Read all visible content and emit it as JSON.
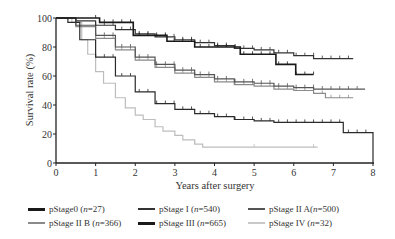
{
  "chart_data": {
    "type": "line",
    "subtype": "kaplan-meier",
    "title": "",
    "xlabel": "Years after surgery",
    "ylabel": "Survival rate (%)",
    "xlim": [
      0,
      8
    ],
    "ylim": [
      0,
      100
    ],
    "xticks": [
      "0",
      "1",
      "2",
      "3",
      "4",
      "5",
      "6",
      "7",
      "8"
    ],
    "yticks": [
      "0",
      "20",
      "40",
      "60",
      "80",
      "100"
    ],
    "grid": false,
    "legend_position": "bottom",
    "series": [
      {
        "name": "pStage0 (n=27)",
        "label_main": "pStage0 (",
        "n": "n",
        "count": "=27)",
        "color": "#1a1a1a",
        "width": 1.6,
        "points": [
          [
            0,
            100
          ],
          [
            0.35,
            100
          ],
          [
            0.35,
            100
          ],
          [
            1.1,
            100
          ],
          [
            1.1,
            97
          ],
          [
            1.95,
            97
          ],
          [
            1.95,
            88
          ],
          [
            2.8,
            88
          ],
          [
            2.8,
            84
          ],
          [
            3.5,
            84
          ],
          [
            3.5,
            80
          ],
          [
            4.65,
            80
          ],
          [
            4.65,
            75
          ],
          [
            5.55,
            75
          ],
          [
            5.55,
            68
          ],
          [
            6.05,
            68
          ],
          [
            6.05,
            61
          ],
          [
            6.5,
            61
          ]
        ]
      },
      {
        "name": "pStage I (n=540)",
        "label_main": "pStage I (",
        "n": "n",
        "count": "=540)",
        "color": "#333333",
        "width": 1.2,
        "points": [
          [
            0,
            100
          ],
          [
            0.5,
            98
          ],
          [
            1.0,
            95
          ],
          [
            1.5,
            92
          ],
          [
            2.0,
            89
          ],
          [
            2.5,
            87
          ],
          [
            3.0,
            85
          ],
          [
            3.5,
            83
          ],
          [
            4.0,
            81
          ],
          [
            4.5,
            79
          ],
          [
            5.0,
            78
          ],
          [
            5.5,
            76
          ],
          [
            6.0,
            74
          ],
          [
            6.5,
            72
          ],
          [
            7.0,
            72
          ],
          [
            7.5,
            72
          ]
        ]
      },
      {
        "name": "pStage II A (n=500)",
        "label_main": "pStage II A(",
        "n": "n",
        "count": "=500)",
        "color": "#555555",
        "width": 1.2,
        "points": [
          [
            0,
            100
          ],
          [
            0.5,
            95
          ],
          [
            1.0,
            88
          ],
          [
            1.5,
            80
          ],
          [
            2.0,
            73
          ],
          [
            2.5,
            68
          ],
          [
            3.0,
            64
          ],
          [
            3.5,
            61
          ],
          [
            4.0,
            58
          ],
          [
            4.5,
            56
          ],
          [
            5.0,
            55
          ],
          [
            5.5,
            53
          ],
          [
            6.0,
            52
          ],
          [
            6.5,
            51
          ],
          [
            7.0,
            51
          ],
          [
            7.5,
            51
          ],
          [
            7.8,
            51
          ]
        ]
      },
      {
        "name": "pStage II B (n=366)",
        "label_main": "pStage II B (",
        "n": "n",
        "count": "=366)",
        "color": "#8a8a8a",
        "width": 1.2,
        "points": [
          [
            0,
            100
          ],
          [
            0.5,
            94
          ],
          [
            1.0,
            86
          ],
          [
            1.5,
            78
          ],
          [
            2.0,
            71
          ],
          [
            2.5,
            66
          ],
          [
            3.0,
            62
          ],
          [
            3.5,
            59
          ],
          [
            4.0,
            56
          ],
          [
            4.5,
            54
          ],
          [
            5.0,
            53
          ],
          [
            5.5,
            51
          ],
          [
            6.0,
            50
          ],
          [
            6.5,
            48
          ],
          [
            6.8,
            48
          ],
          [
            6.8,
            45
          ],
          [
            7.5,
            45
          ]
        ]
      },
      {
        "name": "pStage III (n=665)",
        "label_main": "pStage III (",
        "n": "n",
        "count": "=665)",
        "color": "#2a2a2a",
        "width": 1.2,
        "points": [
          [
            0,
            100
          ],
          [
            0.3,
            97
          ],
          [
            0.6,
            85
          ],
          [
            1.0,
            73
          ],
          [
            1.5,
            60
          ],
          [
            2.0,
            49
          ],
          [
            2.5,
            41
          ],
          [
            3.0,
            37
          ],
          [
            3.5,
            34
          ],
          [
            4.0,
            32
          ],
          [
            4.5,
            30
          ],
          [
            5.0,
            29
          ],
          [
            5.5,
            28
          ],
          [
            6.0,
            28
          ],
          [
            6.5,
            28
          ],
          [
            7.0,
            28
          ],
          [
            7.25,
            28
          ],
          [
            7.25,
            21
          ],
          [
            8.0,
            21
          ],
          [
            8.0,
            0
          ]
        ]
      },
      {
        "name": "pStage IV (n=32)",
        "label_main": "pStage IV (",
        "n": "n",
        "count": "=32)",
        "color": "#bdbdbd",
        "width": 1.2,
        "points": [
          [
            0,
            100
          ],
          [
            0.4,
            97
          ],
          [
            0.65,
            85
          ],
          [
            0.8,
            75
          ],
          [
            1.0,
            63
          ],
          [
            1.2,
            55
          ],
          [
            1.5,
            45
          ],
          [
            1.75,
            38
          ],
          [
            2.0,
            33
          ],
          [
            2.2,
            30
          ],
          [
            2.5,
            25
          ],
          [
            2.7,
            22
          ],
          [
            3.0,
            19
          ],
          [
            3.2,
            16
          ],
          [
            3.5,
            13
          ],
          [
            3.7,
            11
          ],
          [
            4.0,
            11
          ],
          [
            5.0,
            11
          ],
          [
            6.0,
            11
          ],
          [
            6.6,
            11
          ]
        ]
      }
    ]
  }
}
